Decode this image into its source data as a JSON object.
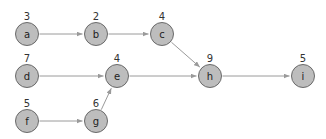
{
  "diagram": {
    "type": "directed-graph",
    "colors": {
      "node_fill": "#bdbdbd",
      "node_stroke": "#6a6a6a",
      "edge": "#9a9a9a",
      "text": "#222222"
    },
    "nodes": [
      {
        "id": "a",
        "label": "a",
        "weight": "3",
        "x": 27,
        "y": 34
      },
      {
        "id": "b",
        "label": "b",
        "weight": "2",
        "x": 96,
        "y": 34
      },
      {
        "id": "c",
        "label": "c",
        "weight": "4",
        "x": 162,
        "y": 34
      },
      {
        "id": "d",
        "label": "d",
        "weight": "7",
        "x": 27,
        "y": 76
      },
      {
        "id": "e",
        "label": "e",
        "weight": "4",
        "x": 117,
        "y": 76
      },
      {
        "id": "h",
        "label": "h",
        "weight": "9",
        "x": 210,
        "y": 76
      },
      {
        "id": "i",
        "label": "i",
        "weight": "5",
        "x": 303,
        "y": 76
      },
      {
        "id": "f",
        "label": "f",
        "weight": "5",
        "x": 27,
        "y": 121
      },
      {
        "id": "g",
        "label": "g",
        "weight": "6",
        "x": 96,
        "y": 121
      }
    ],
    "edges": [
      {
        "from": "a",
        "to": "b"
      },
      {
        "from": "b",
        "to": "c"
      },
      {
        "from": "c",
        "to": "h"
      },
      {
        "from": "d",
        "to": "e"
      },
      {
        "from": "e",
        "to": "h"
      },
      {
        "from": "h",
        "to": "i"
      },
      {
        "from": "f",
        "to": "g"
      },
      {
        "from": "g",
        "to": "e"
      }
    ]
  }
}
